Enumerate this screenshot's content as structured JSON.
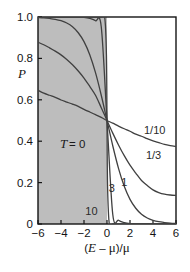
{
  "chart_data": {
    "type": "line",
    "title": "",
    "subtitle": "",
    "xlabel": "(E − μ)/μ",
    "ylabel": "P",
    "xlim": [
      -6,
      6
    ],
    "ylim": [
      0,
      1
    ],
    "grid": false,
    "legend_position": "inline-right",
    "x_ticks": [
      -6,
      -4,
      -2,
      0,
      2,
      4,
      6
    ],
    "x_tick_labels": [
      "−6",
      "−4",
      "−2",
      "0",
      "2",
      "4",
      "6"
    ],
    "y_ticks": [
      0,
      0.2,
      0.4,
      0.6,
      0.8,
      1.0
    ],
    "y_tick_labels": [
      "0",
      "0.2",
      "0.4",
      "0.6",
      "0.8",
      "1.0"
    ],
    "crossing_point": [
      0,
      0.5
    ],
    "shaded_region": {
      "label": "T = 0",
      "label_italic_part": "T",
      "label_rest": "= 0",
      "x_from": -6,
      "x_to": 0,
      "y_from": 0,
      "y_to": 1,
      "color": "#bdbdbd"
    },
    "series": [
      {
        "name": "1/10",
        "label": "1/10",
        "tau": 0.1,
        "label_x": 4.15,
        "label_y": 0.455,
        "color": "#404040",
        "x": [
          -6,
          -5.5,
          -5,
          -4.5,
          -4,
          -3.5,
          -3,
          -2.5,
          -2,
          -1.5,
          -1,
          -0.5,
          0,
          0.5,
          1,
          1.5,
          2,
          2.5,
          3,
          3.5,
          4,
          4.5,
          5,
          5.5,
          6
        ],
        "y": [
          0.646,
          0.632,
          0.622,
          0.612,
          0.599,
          0.589,
          0.579,
          0.568,
          0.554,
          0.541,
          0.528,
          0.515,
          0.5,
          0.487,
          0.473,
          0.46,
          0.448,
          0.434,
          0.424,
          0.412,
          0.401,
          0.393,
          0.385,
          0.379,
          0.374
        ]
      },
      {
        "name": "1/3",
        "label": "1/3",
        "tau": 0.3333,
        "label_x": 4.05,
        "label_y": 0.335,
        "color": "#404040",
        "x": [
          -6,
          -5.5,
          -5,
          -4.5,
          -4,
          -3.5,
          -3,
          -2.5,
          -2,
          -1.5,
          -1,
          -0.5,
          0,
          0.5,
          1,
          1.5,
          2,
          2.5,
          3,
          3.5,
          4,
          4.5,
          5,
          5.5,
          6
        ],
        "y": [
          0.878,
          0.866,
          0.851,
          0.835,
          0.817,
          0.795,
          0.769,
          0.739,
          0.705,
          0.665,
          0.622,
          0.562,
          0.5,
          0.439,
          0.382,
          0.33,
          0.284,
          0.246,
          0.21,
          0.186,
          0.165,
          0.152,
          0.144,
          0.14,
          0.138
        ]
      },
      {
        "name": "1",
        "label": "1",
        "tau": 1,
        "label_x": 1.5,
        "label_y": 0.205,
        "color": "#404040",
        "x": [
          -6,
          -5.5,
          -5,
          -4.5,
          -4,
          -3.5,
          -3,
          -2.5,
          -2,
          -1.5,
          -1,
          -0.5,
          0,
          0.5,
          1,
          1.5,
          2,
          2.5,
          3,
          3.5,
          4,
          4.5,
          5,
          5.5,
          6
        ],
        "y": [
          0.998,
          0.996,
          0.993,
          0.989,
          0.982,
          0.971,
          0.953,
          0.924,
          0.881,
          0.818,
          0.731,
          0.622,
          0.5,
          0.378,
          0.269,
          0.182,
          0.119,
          0.076,
          0.047,
          0.029,
          0.018,
          0.011,
          0.007,
          0.004,
          0.002
        ]
      },
      {
        "name": "3",
        "label": "3",
        "tau": 3,
        "label_x": 0.42,
        "label_y": 0.172,
        "color": "#404040",
        "x": [
          -6,
          -5.5,
          -5,
          -4.5,
          -4,
          -3.5,
          -3,
          -2.5,
          -2,
          -1.5,
          -1,
          -0.5,
          0,
          0.5,
          1,
          1.5,
          2,
          2.5,
          3,
          3.5,
          4,
          4.5,
          5,
          5.5,
          6
        ],
        "y": [
          1.0,
          1.0,
          1.0,
          1.0,
          1.0,
          1.0,
          1.0,
          0.999,
          0.998,
          0.993,
          0.982,
          0.953,
          0.5,
          0.047,
          0.018,
          0.007,
          0.002,
          0.001,
          0.0,
          0.0,
          0.0,
          0.0,
          0.0,
          0.0,
          0.0
        ]
      },
      {
        "name": "10",
        "label": "10",
        "tau": 10,
        "label_x": -1.35,
        "label_y": 0.065,
        "color": "#404040",
        "x": [
          -6,
          -4,
          -2,
          -1,
          -0.5,
          -0.2,
          -0.05,
          0,
          0.05,
          0.2,
          0.5,
          1,
          2,
          4,
          6
        ],
        "y": [
          1.0,
          1.0,
          1.0,
          1.0,
          1.0,
          0.999,
          0.82,
          0.5,
          0.18,
          0.001,
          0.0,
          0.0,
          0.0,
          0.0,
          0.0
        ]
      }
    ]
  },
  "style": {
    "background": "#ffffff",
    "axis_color": "#141414",
    "curve_color": "#404040",
    "shade_color": "#bdbdbd"
  }
}
